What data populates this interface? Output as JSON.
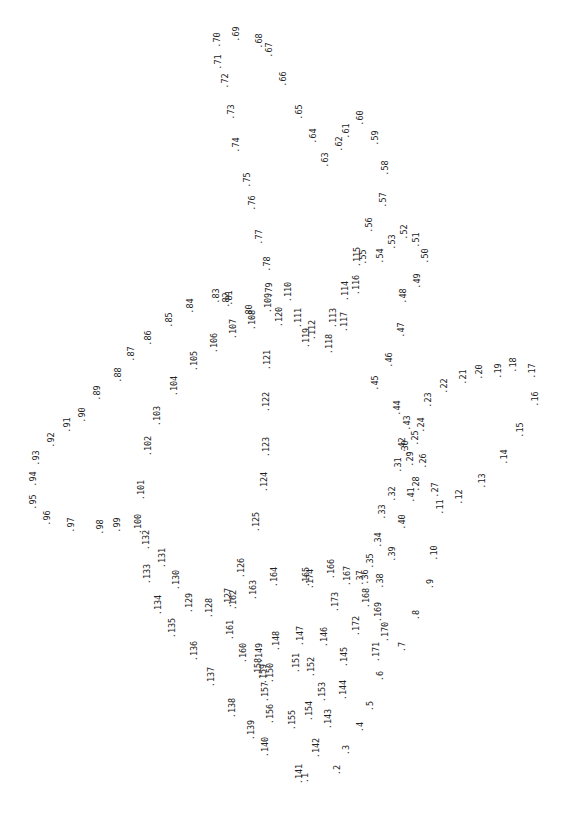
{
  "puzzle": {
    "type": "connect-the-dots",
    "orientation": "rotated 90deg counter-clockwise",
    "background": "#ffffff",
    "ink": "#222222",
    "points": [
      {
        "n": "1",
        "x": 305,
        "y": 778
      },
      {
        "n": "2",
        "x": 337,
        "y": 770
      },
      {
        "n": "3",
        "x": 346,
        "y": 750
      },
      {
        "n": "4",
        "x": 360,
        "y": 727
      },
      {
        "n": "5",
        "x": 370,
        "y": 706
      },
      {
        "n": "6",
        "x": 380,
        "y": 676
      },
      {
        "n": "7",
        "x": 402,
        "y": 647
      },
      {
        "n": "8",
        "x": 416,
        "y": 615
      },
      {
        "n": "9",
        "x": 430,
        "y": 584
      },
      {
        "n": "10",
        "x": 434,
        "y": 553
      },
      {
        "n": "11",
        "x": 440,
        "y": 507
      },
      {
        "n": "12",
        "x": 459,
        "y": 497
      },
      {
        "n": "13",
        "x": 482,
        "y": 481
      },
      {
        "n": "14",
        "x": 504,
        "y": 457
      },
      {
        "n": "15",
        "x": 520,
        "y": 430
      },
      {
        "n": "16",
        "x": 535,
        "y": 399
      },
      {
        "n": "17",
        "x": 532,
        "y": 371
      },
      {
        "n": "18",
        "x": 513,
        "y": 365
      },
      {
        "n": "19",
        "x": 498,
        "y": 371
      },
      {
        "n": "20",
        "x": 479,
        "y": 372
      },
      {
        "n": "21",
        "x": 463,
        "y": 377
      },
      {
        "n": "22",
        "x": 444,
        "y": 386
      },
      {
        "n": "23",
        "x": 428,
        "y": 400
      },
      {
        "n": "24",
        "x": 421,
        "y": 425
      },
      {
        "n": "25",
        "x": 415,
        "y": 438
      },
      {
        "n": "26",
        "x": 423,
        "y": 461
      },
      {
        "n": "27",
        "x": 435,
        "y": 490
      },
      {
        "n": "28",
        "x": 416,
        "y": 484
      },
      {
        "n": "29",
        "x": 410,
        "y": 459
      },
      {
        "n": "30",
        "x": 405,
        "y": 448
      },
      {
        "n": "31",
        "x": 398,
        "y": 465
      },
      {
        "n": "32",
        "x": 392,
        "y": 494
      },
      {
        "n": "33",
        "x": 382,
        "y": 512
      },
      {
        "n": "34",
        "x": 378,
        "y": 540
      },
      {
        "n": "35",
        "x": 370,
        "y": 561
      },
      {
        "n": "36",
        "x": 365,
        "y": 577
      },
      {
        "n": "37",
        "x": 360,
        "y": 578
      },
      {
        "n": "38",
        "x": 380,
        "y": 581
      },
      {
        "n": "39",
        "x": 392,
        "y": 554
      },
      {
        "n": "40",
        "x": 402,
        "y": 522
      },
      {
        "n": "41",
        "x": 411,
        "y": 495
      },
      {
        "n": "42",
        "x": 402,
        "y": 445
      },
      {
        "n": "43",
        "x": 407,
        "y": 423
      },
      {
        "n": "44",
        "x": 397,
        "y": 408
      },
      {
        "n": "45",
        "x": 375,
        "y": 383
      },
      {
        "n": "46",
        "x": 389,
        "y": 360
      },
      {
        "n": "47",
        "x": 401,
        "y": 330
      },
      {
        "n": "48",
        "x": 403,
        "y": 296
      },
      {
        "n": "49",
        "x": 417,
        "y": 281
      },
      {
        "n": "50",
        "x": 425,
        "y": 256
      },
      {
        "n": "51",
        "x": 416,
        "y": 240
      },
      {
        "n": "52",
        "x": 404,
        "y": 232
      },
      {
        "n": "53",
        "x": 392,
        "y": 242
      },
      {
        "n": "54",
        "x": 380,
        "y": 256
      },
      {
        "n": "55",
        "x": 363,
        "y": 257
      },
      {
        "n": "56",
        "x": 369,
        "y": 225
      },
      {
        "n": "57",
        "x": 383,
        "y": 200
      },
      {
        "n": "58",
        "x": 385,
        "y": 168
      },
      {
        "n": "59",
        "x": 375,
        "y": 138
      },
      {
        "n": "60",
        "x": 360,
        "y": 118
      },
      {
        "n": "61",
        "x": 346,
        "y": 131
      },
      {
        "n": "62",
        "x": 339,
        "y": 144
      },
      {
        "n": "63",
        "x": 325,
        "y": 160
      },
      {
        "n": "64",
        "x": 313,
        "y": 136
      },
      {
        "n": "65",
        "x": 299,
        "y": 112
      },
      {
        "n": "66",
        "x": 283,
        "y": 79
      },
      {
        "n": "67",
        "x": 269,
        "y": 50
      },
      {
        "n": "68",
        "x": 259,
        "y": 41
      },
      {
        "n": "69",
        "x": 236,
        "y": 34
      },
      {
        "n": "70",
        "x": 217,
        "y": 40
      },
      {
        "n": "71",
        "x": 218,
        "y": 62
      },
      {
        "n": "72",
        "x": 225,
        "y": 81
      },
      {
        "n": "73",
        "x": 231,
        "y": 112
      },
      {
        "n": "74",
        "x": 236,
        "y": 145
      },
      {
        "n": "75",
        "x": 247,
        "y": 180
      },
      {
        "n": "76",
        "x": 252,
        "y": 203
      },
      {
        "n": "77",
        "x": 259,
        "y": 237
      },
      {
        "n": "78",
        "x": 267,
        "y": 264
      },
      {
        "n": "79",
        "x": 269,
        "y": 290
      },
      {
        "n": "80",
        "x": 249,
        "y": 312
      },
      {
        "n": "81",
        "x": 229,
        "y": 298
      },
      {
        "n": "82",
        "x": 226,
        "y": 300
      },
      {
        "n": "83",
        "x": 216,
        "y": 296
      },
      {
        "n": "84",
        "x": 190,
        "y": 306
      },
      {
        "n": "85",
        "x": 169,
        "y": 320
      },
      {
        "n": "86",
        "x": 148,
        "y": 338
      },
      {
        "n": "87",
        "x": 131,
        "y": 354
      },
      {
        "n": "88",
        "x": 118,
        "y": 375
      },
      {
        "n": "89",
        "x": 97,
        "y": 393
      },
      {
        "n": "90",
        "x": 82,
        "y": 415
      },
      {
        "n": "91",
        "x": 67,
        "y": 425
      },
      {
        "n": "92",
        "x": 51,
        "y": 440
      },
      {
        "n": "93",
        "x": 36,
        "y": 458
      },
      {
        "n": "94",
        "x": 33,
        "y": 479
      },
      {
        "n": "95",
        "x": 33,
        "y": 502
      },
      {
        "n": "96",
        "x": 47,
        "y": 518
      },
      {
        "n": "97",
        "x": 71,
        "y": 525
      },
      {
        "n": "98",
        "x": 100,
        "y": 527
      },
      {
        "n": "99",
        "x": 117,
        "y": 525
      },
      {
        "n": "100",
        "x": 138,
        "y": 524
      },
      {
        "n": "101",
        "x": 141,
        "y": 490
      },
      {
        "n": "102",
        "x": 148,
        "y": 446
      },
      {
        "n": "103",
        "x": 157,
        "y": 416
      },
      {
        "n": "104",
        "x": 174,
        "y": 386
      },
      {
        "n": "105",
        "x": 194,
        "y": 361
      },
      {
        "n": "106",
        "x": 214,
        "y": 343
      },
      {
        "n": "107",
        "x": 233,
        "y": 329
      },
      {
        "n": "108",
        "x": 252,
        "y": 320
      },
      {
        "n": "109",
        "x": 268,
        "y": 303
      },
      {
        "n": "110",
        "x": 288,
        "y": 292
      },
      {
        "n": "111",
        "x": 298,
        "y": 318
      },
      {
        "n": "112",
        "x": 312,
        "y": 330
      },
      {
        "n": "113",
        "x": 333,
        "y": 318
      },
      {
        "n": "114",
        "x": 345,
        "y": 291
      },
      {
        "n": "115",
        "x": 357,
        "y": 257
      },
      {
        "n": "116",
        "x": 356,
        "y": 285
      },
      {
        "n": "117",
        "x": 344,
        "y": 322
      },
      {
        "n": "118",
        "x": 329,
        "y": 344
      },
      {
        "n": "119",
        "x": 306,
        "y": 338
      },
      {
        "n": "120",
        "x": 279,
        "y": 317
      },
      {
        "n": "121",
        "x": 267,
        "y": 360
      },
      {
        "n": "122",
        "x": 266,
        "y": 402
      },
      {
        "n": "123",
        "x": 266,
        "y": 447
      },
      {
        "n": "124",
        "x": 264,
        "y": 482
      },
      {
        "n": "125",
        "x": 256,
        "y": 522
      },
      {
        "n": "126",
        "x": 241,
        "y": 568
      },
      {
        "n": "127",
        "x": 228,
        "y": 598
      },
      {
        "n": "128",
        "x": 209,
        "y": 608
      },
      {
        "n": "129",
        "x": 189,
        "y": 603
      },
      {
        "n": "130",
        "x": 176,
        "y": 580
      },
      {
        "n": "131",
        "x": 162,
        "y": 558
      },
      {
        "n": "132",
        "x": 146,
        "y": 540
      },
      {
        "n": "133",
        "x": 147,
        "y": 574
      },
      {
        "n": "134",
        "x": 158,
        "y": 605
      },
      {
        "n": "135",
        "x": 172,
        "y": 628
      },
      {
        "n": "136",
        "x": 194,
        "y": 651
      },
      {
        "n": "137",
        "x": 211,
        "y": 677
      },
      {
        "n": "138",
        "x": 232,
        "y": 708
      },
      {
        "n": "139",
        "x": 251,
        "y": 730
      },
      {
        "n": "140",
        "x": 265,
        "y": 747
      },
      {
        "n": "141",
        "x": 299,
        "y": 774
      },
      {
        "n": "142",
        "x": 316,
        "y": 748
      },
      {
        "n": "143",
        "x": 328,
        "y": 719
      },
      {
        "n": "144",
        "x": 343,
        "y": 690
      },
      {
        "n": "145",
        "x": 344,
        "y": 657
      },
      {
        "n": "146",
        "x": 324,
        "y": 637
      },
      {
        "n": "147",
        "x": 300,
        "y": 636
      },
      {
        "n": "148",
        "x": 276,
        "y": 641
      },
      {
        "n": "149",
        "x": 259,
        "y": 653
      },
      {
        "n": "150",
        "x": 270,
        "y": 673
      },
      {
        "n": "151",
        "x": 296,
        "y": 663
      },
      {
        "n": "152",
        "x": 311,
        "y": 667
      },
      {
        "n": "153",
        "x": 322,
        "y": 692
      },
      {
        "n": "154",
        "x": 309,
        "y": 711
      },
      {
        "n": "155",
        "x": 292,
        "y": 720
      },
      {
        "n": "156",
        "x": 270,
        "y": 714
      },
      {
        "n": "157",
        "x": 265,
        "y": 692
      },
      {
        "n": "158",
        "x": 258,
        "y": 668
      },
      {
        "n": "159",
        "x": 263,
        "y": 674
      },
      {
        "n": "160",
        "x": 243,
        "y": 653
      },
      {
        "n": "161",
        "x": 230,
        "y": 630
      },
      {
        "n": "162",
        "x": 233,
        "y": 600
      },
      {
        "n": "163",
        "x": 253,
        "y": 590
      },
      {
        "n": "164",
        "x": 274,
        "y": 577
      },
      {
        "n": "165",
        "x": 306,
        "y": 577
      },
      {
        "n": "166",
        "x": 331,
        "y": 569
      },
      {
        "n": "167",
        "x": 347,
        "y": 576
      },
      {
        "n": "168",
        "x": 366,
        "y": 598
      },
      {
        "n": "169",
        "x": 378,
        "y": 612
      },
      {
        "n": "170",
        "x": 385,
        "y": 632
      },
      {
        "n": "171",
        "x": 376,
        "y": 652
      },
      {
        "n": "172",
        "x": 356,
        "y": 626
      },
      {
        "n": "173",
        "x": 335,
        "y": 602
      },
      {
        "n": "174",
        "x": 310,
        "y": 579
      }
    ]
  }
}
